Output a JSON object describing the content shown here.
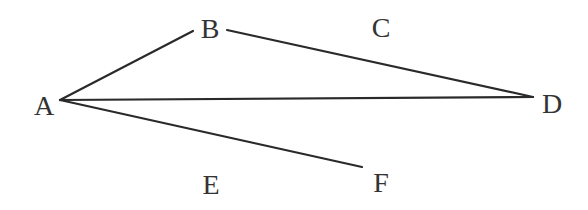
{
  "diagram": {
    "colors": {
      "line": "#2a2a2a",
      "label": "#333333",
      "background": "#ffffff"
    },
    "labels": {
      "A": "A",
      "B": "B",
      "C": "C",
      "D": "D",
      "E": "E",
      "F": "F"
    },
    "segments": [
      {
        "id": "A-B",
        "from": [
          60,
          100
        ],
        "to": [
          193,
          31
        ]
      },
      {
        "id": "B-D",
        "from": [
          227,
          30
        ],
        "to": [
          533,
          97
        ]
      },
      {
        "id": "A-D",
        "from": [
          60,
          100
        ],
        "to": [
          533,
          97
        ]
      },
      {
        "id": "A-F",
        "from": [
          60,
          100
        ],
        "to": [
          362,
          167
        ]
      }
    ]
  }
}
